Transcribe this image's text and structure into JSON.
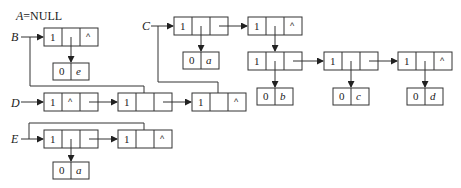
{
  "diagram": {
    "type": "generalized-list-storage-structure",
    "labels": {
      "a_null": "A=NULL",
      "a_name": "A",
      "a_eq": "=NULL",
      "b": "B",
      "c": "C",
      "d": "D",
      "e": "E"
    },
    "symbols": {
      "null_pointer": "^",
      "tag_list": "1",
      "tag_atom": "0"
    },
    "atoms": {
      "b_atom": {
        "tag": "0",
        "value": "e"
      },
      "c_atom": {
        "tag": "0",
        "value": "a"
      },
      "row_atom1": {
        "tag": "0",
        "value": "b"
      },
      "row_atom2": {
        "tag": "0",
        "value": "c"
      },
      "row_atom3": {
        "tag": "0",
        "value": "d"
      },
      "e_atom": {
        "tag": "0",
        "value": "a"
      }
    },
    "nodes": {
      "b1": {
        "tag": "1",
        "head": "",
        "tail": "^"
      },
      "c1": {
        "tag": "1",
        "head": "",
        "tail": ""
      },
      "c2": {
        "tag": "1",
        "head": "",
        "tail": "^"
      },
      "r1": {
        "tag": "1",
        "head": "",
        "tail": ""
      },
      "r2": {
        "tag": "1",
        "head": "",
        "tail": ""
      },
      "r3": {
        "tag": "1",
        "head": "",
        "tail": "^"
      },
      "d1": {
        "tag": "1",
        "head": "^",
        "tail": ""
      },
      "d2": {
        "tag": "1",
        "head": "",
        "tail": ""
      },
      "d3": {
        "tag": "1",
        "head": "",
        "tail": "^"
      },
      "e1": {
        "tag": "1",
        "head": "",
        "tail": ""
      },
      "e2": {
        "tag": "1",
        "head": "",
        "tail": "^"
      }
    },
    "colors": {
      "stroke": "#333333",
      "background": "#ffffff",
      "text": "#222222"
    }
  }
}
